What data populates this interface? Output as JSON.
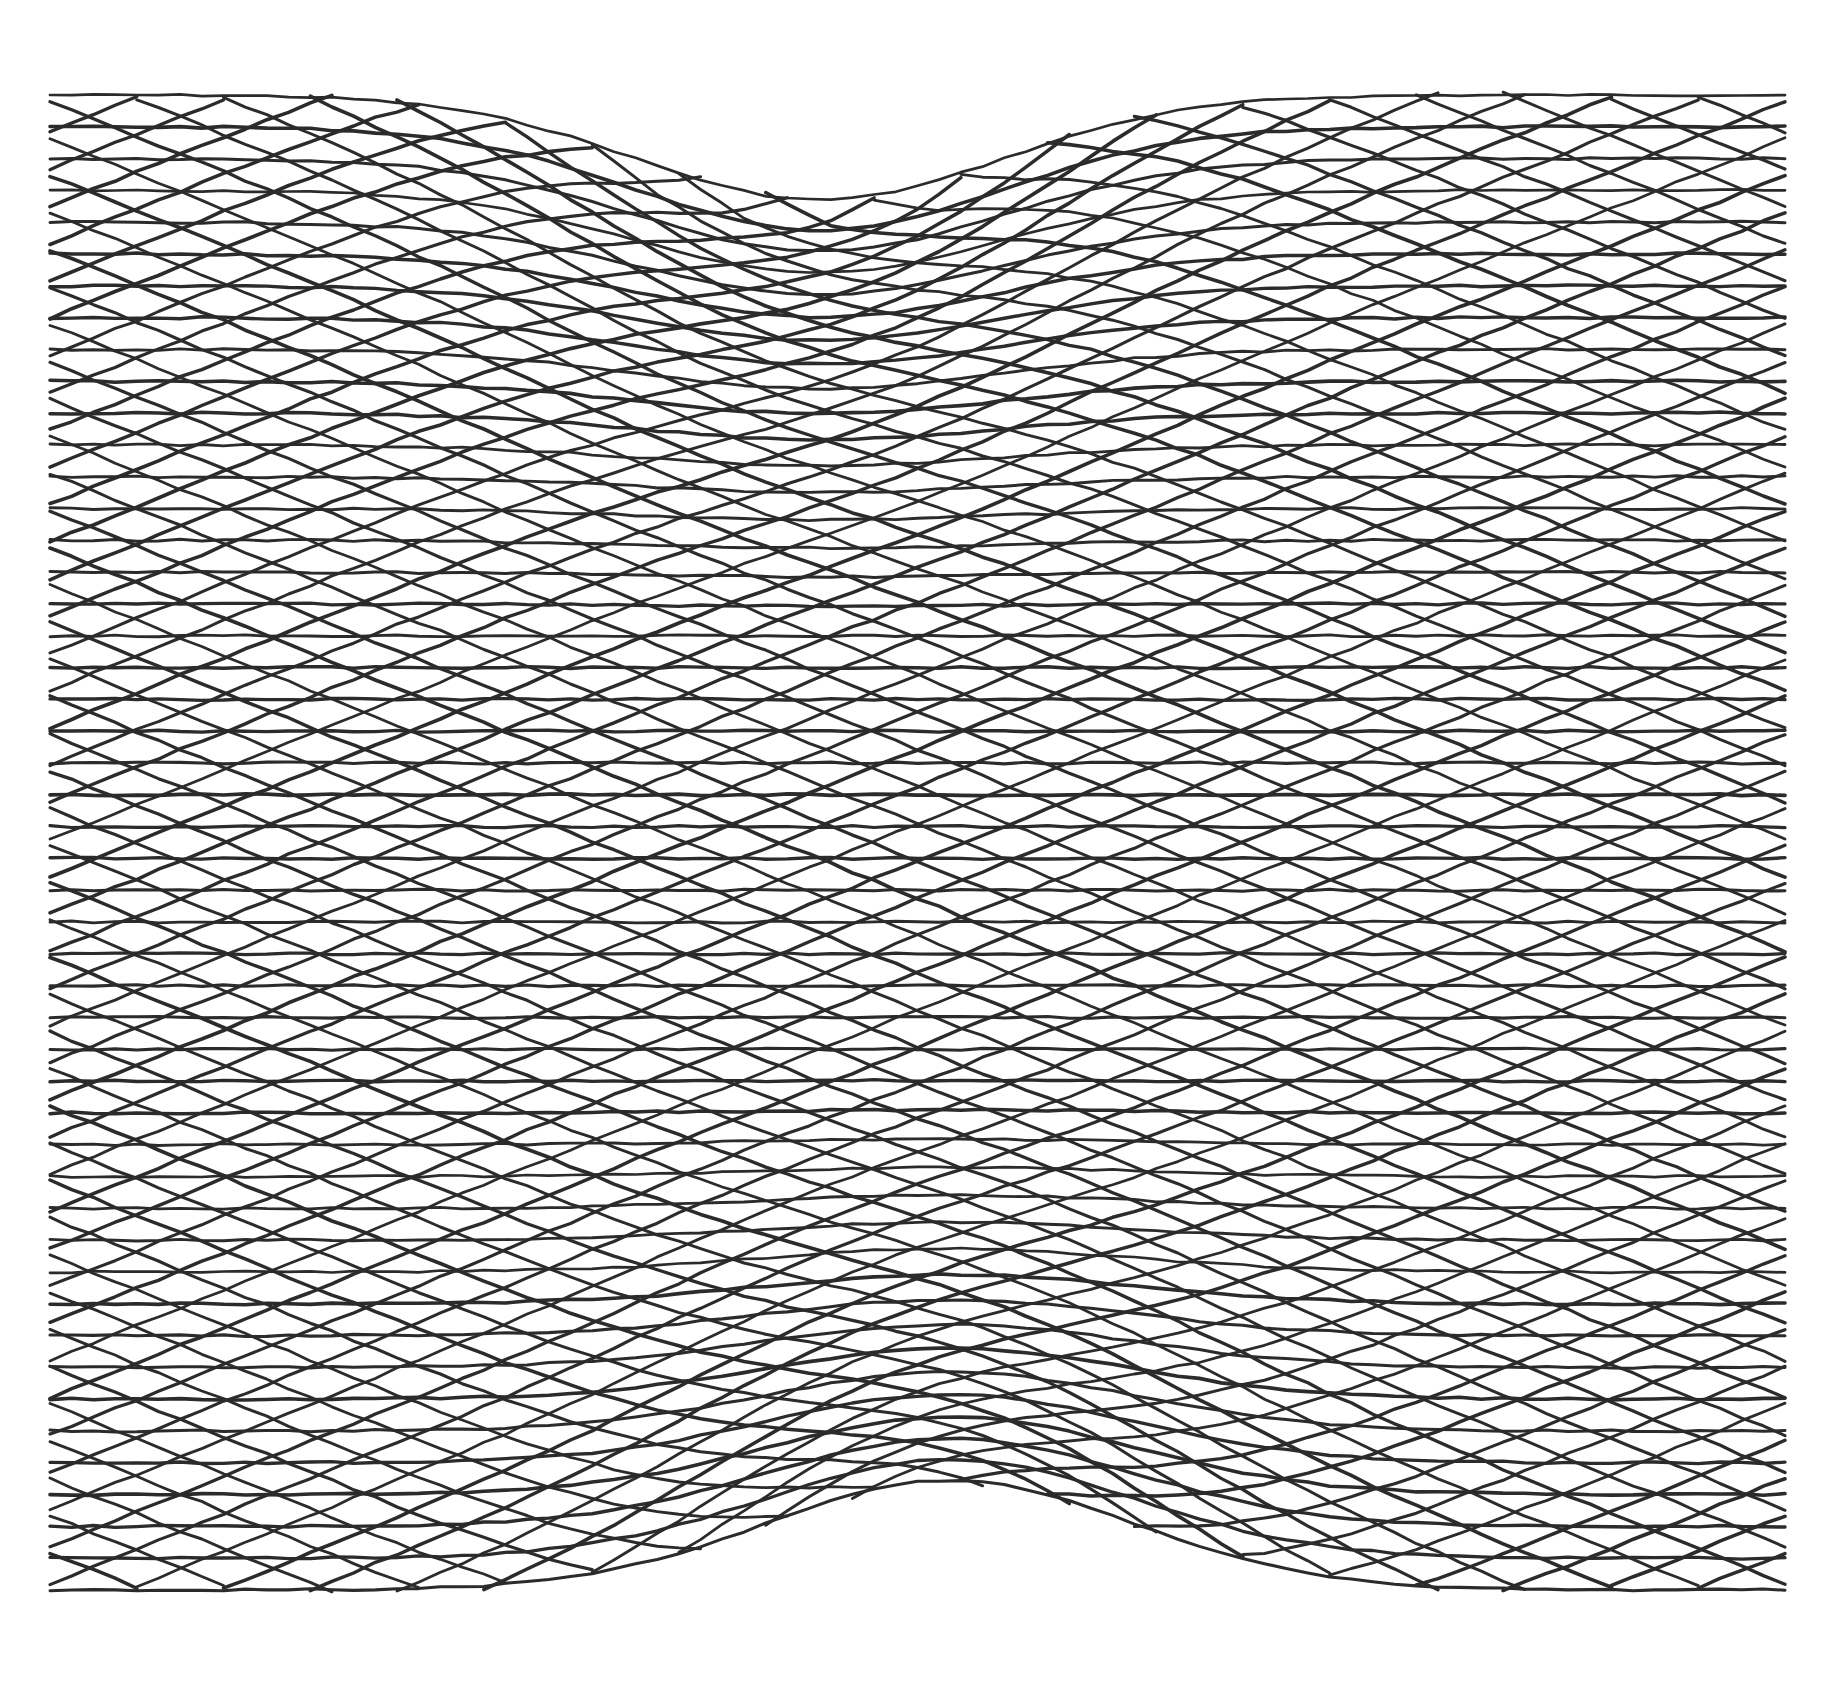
{
  "artwork": {
    "description": "Pen-and-ink moire line drawing: dense families of crossing lines warped around two focal points",
    "background": "#ffffff",
    "ink_color": "#2b2b2b",
    "stroke_width": 3.2,
    "frame": {
      "left": 50,
      "top": 95,
      "right": 1785,
      "bottom": 1590
    },
    "focal_points": [
      {
        "name": "top-focus",
        "x": 820,
        "y": 120,
        "direction": "down",
        "strength": 1.0
      },
      {
        "name": "bottom-focus",
        "x": 950,
        "y": 1590,
        "direction": "up",
        "strength": 1.0
      }
    ],
    "line_families": [
      {
        "name": "horizontal",
        "count": 48,
        "angle_deg": 0
      },
      {
        "name": "diagonal-down",
        "count": 60,
        "angle_deg": 22
      },
      {
        "name": "diagonal-up",
        "count": 60,
        "angle_deg": -22
      }
    ]
  }
}
